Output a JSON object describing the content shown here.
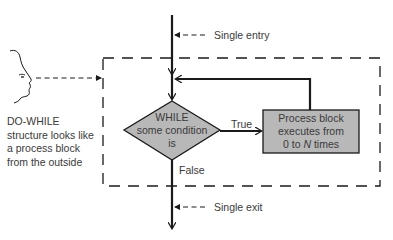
{
  "diagram": {
    "type": "flowchart",
    "title": "DO-WHILE structure",
    "entry_label": "Single entry",
    "exit_label": "Single exit",
    "decision": {
      "lines": [
        "WHILE",
        "some condition",
        "is"
      ]
    },
    "process": {
      "lines": [
        "Process block",
        "executes from",
        "0 to ",
        "N",
        " times"
      ],
      "line1": "Process block",
      "line2": "executes from",
      "line3_prefix": "0 to ",
      "line3_var": "N",
      "line3_suffix": " times"
    },
    "true_label": "True",
    "false_label": "False",
    "caption": {
      "lines": [
        "DO-WHILE",
        "structure looks like",
        "a process block",
        "from the outside"
      ]
    },
    "colors": {
      "shape_fill": "#b8b8b8",
      "line": "#1a1a1a",
      "text": "#3a3a3a",
      "background": "#ffffff"
    }
  }
}
